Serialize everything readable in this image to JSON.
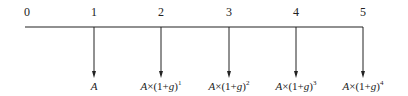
{
  "diagram": {
    "type": "cash-flow-timeline",
    "periods": [
      "0",
      "1",
      "2",
      "3",
      "4",
      "5"
    ],
    "flows": [
      {
        "period": "1",
        "base": "A",
        "expr": "",
        "exponent": ""
      },
      {
        "period": "2",
        "base": "A",
        "expr": "×(1+g)",
        "exponent": "1"
      },
      {
        "period": "3",
        "base": "A",
        "expr": "×(1+g)",
        "exponent": "2"
      },
      {
        "period": "4",
        "base": "A",
        "expr": "×(1+g)",
        "exponent": "3"
      },
      {
        "period": "5",
        "base": "A",
        "expr": "×(1+g)",
        "exponent": "4"
      }
    ],
    "line_color": "#222222"
  }
}
